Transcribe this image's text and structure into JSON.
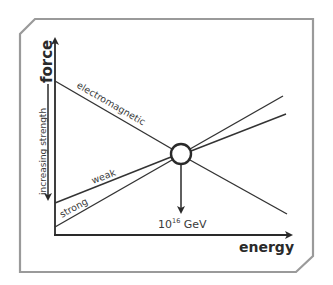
{
  "diagram": {
    "axes": {
      "y_label": "force",
      "x_label": "energy",
      "y_side_label": "increasing strength"
    },
    "lines": [
      {
        "name": "electromagnetic",
        "label": "electromagnetic"
      },
      {
        "name": "weak",
        "label": "weak"
      },
      {
        "name": "strong",
        "label": "strong"
      }
    ],
    "unification_point": {
      "label_base": "10",
      "label_exp": "16",
      "label_unit": " GeV"
    },
    "colors": {
      "frame": "#9a9a9a",
      "line": "#333333",
      "text": "#3a3a3a",
      "background": "#ffffff"
    }
  }
}
